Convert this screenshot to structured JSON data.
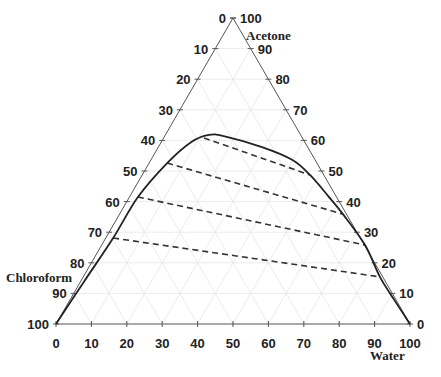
{
  "chart_data": {
    "type": "ternary",
    "title": "",
    "axes": {
      "acetone": {
        "label": "Acetone",
        "ticks": [
          0,
          10,
          20,
          30,
          40,
          50,
          60,
          70,
          80,
          90,
          100
        ],
        "side": "right"
      },
      "chloroform": {
        "label": "Chloroform",
        "ticks": [
          0,
          10,
          20,
          30,
          40,
          50,
          60,
          70,
          80,
          90,
          100
        ],
        "side": "left"
      },
      "water": {
        "label": "Water",
        "ticks": [
          0,
          10,
          20,
          30,
          40,
          50,
          60,
          70,
          80,
          90,
          100
        ],
        "side": "bottom"
      }
    },
    "vertices": {
      "top": "Acetone",
      "bottom_left": "Chloroform",
      "bottom_right": "Water"
    },
    "grid": true,
    "binodal_curve": {
      "style": "solid",
      "points": [
        {
          "acetone": 0.0,
          "water": 0.0,
          "chloroform": 100.0
        },
        {
          "acetone": 14.0,
          "water": 1.0,
          "chloroform": 85.0
        },
        {
          "acetone": 28.1,
          "water": 2.1,
          "chloroform": 69.8
        },
        {
          "acetone": 41.5,
          "water": 2.4,
          "chloroform": 56.1
        },
        {
          "acetone": 52.6,
          "water": 5.1,
          "chloroform": 42.3
        },
        {
          "acetone": 59.5,
          "water": 8.5,
          "chloroform": 32.0
        },
        {
          "acetone": 61.8,
          "water": 12.3,
          "chloroform": 25.9
        },
        {
          "acetone": 61.4,
          "water": 16.7,
          "chloroform": 21.9
        },
        {
          "acetone": 57.8,
          "water": 29.3,
          "chloroform": 12.9
        },
        {
          "acetone": 53.6,
          "water": 40.0,
          "chloroform": 6.4
        },
        {
          "acetone": 48.7,
          "water": 47.4,
          "chloroform": 3.9
        },
        {
          "acetone": 41.8,
          "water": 56.0,
          "chloroform": 2.2
        },
        {
          "acetone": 35.9,
          "water": 63.1,
          "chloroform": 1.0
        },
        {
          "acetone": 25.8,
          "water": 74.4,
          "chloroform": 0.0
        },
        {
          "acetone": 15.4,
          "water": 83.8,
          "chloroform": 0.8
        },
        {
          "acetone": 7.8,
          "water": 91.7,
          "chloroform": 0.5
        },
        {
          "acetone": 0.0,
          "water": 100.0,
          "chloroform": 0.0
        }
      ]
    },
    "tie_lines": [
      {
        "style": "dashed",
        "chloroform_rich": {
          "acetone": 60.8,
          "water": 11.4,
          "chloroform": 27.8
        },
        "water_rich": {
          "acetone": 48.7,
          "water": 47.4,
          "chloroform": 3.9
        }
      },
      {
        "style": "dashed",
        "chloroform_rich": {
          "acetone": 52.6,
          "water": 5.1,
          "chloroform": 42.3
        },
        "water_rich": {
          "acetone": 35.9,
          "water": 63.1,
          "chloroform": 1.0
        }
      },
      {
        "style": "dashed",
        "chloroform_rich": {
          "acetone": 41.5,
          "water": 2.4,
          "chloroform": 56.1
        },
        "water_rich": {
          "acetone": 25.8,
          "water": 74.4,
          "chloroform": 0.0
        }
      },
      {
        "style": "dashed",
        "chloroform_rich": {
          "acetone": 28.1,
          "water": 2.1,
          "chloroform": 69.8
        },
        "water_rich": {
          "acetone": 15.4,
          "water": 83.8,
          "chloroform": 0.8
        }
      }
    ],
    "colors": {
      "axis": "#555555",
      "curve": "#222222",
      "tie_line": "#333333",
      "grid": "#e6e6e6",
      "text": "#222222"
    }
  }
}
